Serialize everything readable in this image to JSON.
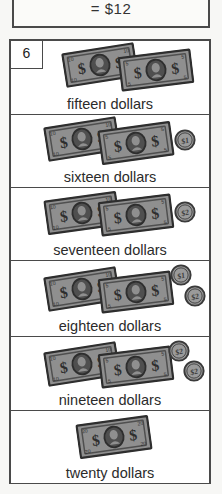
{
  "top_box": {
    "text": "= $12"
  },
  "item": {
    "number": "6"
  },
  "colors": {
    "border": "#4a4a4a",
    "bill_face": "#8f8f8f",
    "bill_dark": "#4f4f4f",
    "bill_edge": "#2e2e2e",
    "coin_face": "#9a9a9a",
    "coin_edge": "#3a3a3a",
    "page_bg": "#ffffff",
    "text": "#2b2b2b"
  },
  "rows": [
    {
      "caption": "fifteen dollars",
      "bills": [
        {
          "label": "10",
          "x": 52,
          "y": 6,
          "rot": -9
        },
        {
          "label": "5",
          "x": 108,
          "y": 11,
          "rot": -7
        }
      ],
      "coins": []
    },
    {
      "caption": "sixteen dollars",
      "bills": [
        {
          "label": "10",
          "x": 34,
          "y": 6,
          "rot": -9
        },
        {
          "label": "5",
          "x": 88,
          "y": 10,
          "rot": -8
        }
      ],
      "coins": [
        {
          "label": "$1",
          "x": 163,
          "y": 14
        }
      ]
    },
    {
      "caption": "seventeen dollars",
      "bills": [
        {
          "label": "10",
          "x": 34,
          "y": 7,
          "rot": -8
        },
        {
          "label": "5",
          "x": 88,
          "y": 9,
          "rot": -7
        }
      ],
      "coins": [
        {
          "label": "$2",
          "x": 163,
          "y": 13
        }
      ]
    },
    {
      "caption": "eighteen dollars",
      "bills": [
        {
          "label": "10",
          "x": 34,
          "y": 10,
          "rot": -9
        },
        {
          "label": "5",
          "x": 88,
          "y": 13,
          "rot": -7
        }
      ],
      "coins": [
        {
          "label": "$1",
          "x": 159,
          "y": 3
        },
        {
          "label": "$2",
          "x": 173,
          "y": 24
        }
      ]
    },
    {
      "caption": "nineteen dollars",
      "bills": [
        {
          "label": "10",
          "x": 34,
          "y": 9,
          "rot": -9
        },
        {
          "label": "5",
          "x": 88,
          "y": 12,
          "rot": -7
        }
      ],
      "coins": [
        {
          "label": "$2",
          "x": 157,
          "y": 3
        },
        {
          "label": "$2",
          "x": 172,
          "y": 23
        }
      ]
    },
    {
      "caption": "twenty dollars",
      "bills": [
        {
          "label": "20",
          "x": 66,
          "y": 8,
          "rot": -8
        }
      ],
      "coins": []
    }
  ]
}
